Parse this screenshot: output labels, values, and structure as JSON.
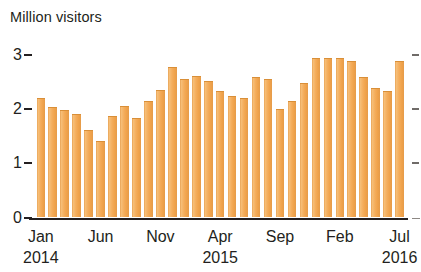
{
  "chart_data": {
    "type": "bar",
    "title": "Million visitors",
    "xlabel": "",
    "ylabel": "Million visitors",
    "ylim": [
      0,
      3
    ],
    "y_ticks": [
      0,
      1,
      2,
      3
    ],
    "y_tick_labels": [
      "0",
      "1",
      "2",
      "3"
    ],
    "grid": false,
    "legend": null,
    "bar_color": "#F2A94E",
    "categories": [
      "Jan 2014",
      "Feb 2014",
      "Mar 2014",
      "Apr 2014",
      "May 2014",
      "Jun 2014",
      "Jul 2014",
      "Aug 2014",
      "Sep 2014",
      "Oct 2014",
      "Nov 2014",
      "Dec 2014",
      "Jan 2015",
      "Feb 2015",
      "Mar 2015",
      "Apr 2015",
      "May 2015",
      "Jun 2015",
      "Jul 2015",
      "Aug 2015",
      "Sep 2015",
      "Oct 2015",
      "Nov 2015",
      "Dec 2015",
      "Jan 2016",
      "Feb 2016",
      "Mar 2016",
      "Apr 2016",
      "May 2016",
      "Jun 2016",
      "Jul 2016"
    ],
    "values": [
      2.2,
      2.04,
      1.98,
      1.91,
      1.62,
      1.4,
      1.87,
      2.05,
      1.83,
      2.15,
      2.34,
      2.78,
      2.55,
      2.6,
      2.51,
      2.33,
      2.24,
      2.2,
      2.59,
      2.55,
      2.0,
      2.15,
      2.48,
      2.93,
      2.94,
      2.94,
      2.89,
      2.58,
      2.39,
      2.33,
      2.89
    ],
    "x_tick_labels": [
      "Jan",
      "Jun",
      "Nov",
      "Apr",
      "Sep",
      "Feb",
      "Jul"
    ],
    "x_tick_indices": [
      0,
      5,
      10,
      15,
      20,
      25,
      30
    ],
    "x_year_labels": [
      {
        "label": "2014",
        "index": 0
      },
      {
        "label": "2015",
        "index": 15
      },
      {
        "label": "2016",
        "index": 30
      }
    ]
  }
}
